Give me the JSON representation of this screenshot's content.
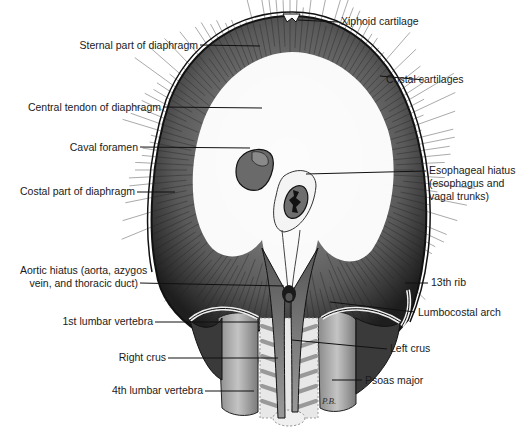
{
  "diagram": {
    "artist_initials": "P.B.",
    "labels": {
      "xiphoid": "Xiphoid cartilage",
      "sternal": "Sternal part of diaphragm",
      "costal_cartilages": "Costal cartilages",
      "central_tendon": "Central tendon of diaphragm",
      "caval_foramen": "Caval foramen",
      "esophageal_1": "Esophageal hiatus",
      "esophageal_2": "(esophagus and",
      "esophageal_3": "vagal trunks)",
      "costal_part": "Costal part of diaphragm",
      "aortic_1": "Aortic hiatus (aorta, azygos",
      "aortic_2": "vein, and thoracic duct)",
      "rib13": "13th rib",
      "lumbar1": "1st lumbar vertebra",
      "lumbocostal": "Lumbocostal arch",
      "left_crus": "Left crus",
      "right_crus": "Right crus",
      "psoas": "Psoas major",
      "lumbar4": "4th lumbar vertebra"
    }
  }
}
